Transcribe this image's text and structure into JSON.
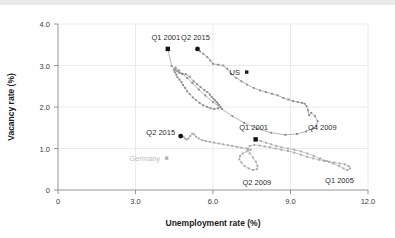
{
  "chart_data": {
    "type": "scatter",
    "title": "",
    "xlabel": "Unemployment rate (%)",
    "ylabel": "Vacancy rate (%)",
    "xlim": [
      0,
      12.0
    ],
    "ylim": [
      0,
      4.0
    ],
    "xticks": [
      "0",
      "3.0",
      "6.0",
      "9.0",
      "12.0"
    ],
    "xtick_values": [
      0,
      3.0,
      6.0,
      9.0,
      12.0
    ],
    "yticks": [
      "0",
      "1.0",
      "2.0",
      "3.0",
      "4.0"
    ],
    "ytick_values": [
      0,
      1.0,
      2.0,
      3.0,
      4.0
    ],
    "grid": "horizontal-and-vertical-light",
    "legend_position": "inside-plot",
    "legend": [
      {
        "name": "US",
        "marker": "square",
        "color": "#1a1a1a"
      },
      {
        "name": "Germany",
        "marker": "square",
        "color": "#b4b4b4"
      }
    ],
    "annotations": [
      {
        "text": "Q1 2001",
        "series": "US",
        "x": 4.25,
        "y": 3.4,
        "marker": "square",
        "label_dx": -2,
        "label_dy": -9
      },
      {
        "text": "Q2 2015",
        "series": "US",
        "x": 5.4,
        "y": 3.4,
        "marker": "circle",
        "label_dx": -2,
        "label_dy": -9
      },
      {
        "text": "Q4 2009",
        "series": "US",
        "x": 10.0,
        "y": 1.55,
        "marker": "none",
        "label_dx": 6,
        "label_dy": 4
      },
      {
        "text": "Q1 2001",
        "series": "Germany",
        "x": 7.65,
        "y": 1.22,
        "marker": "square",
        "label_dx": -2,
        "label_dy": -9
      },
      {
        "text": "Q2 2015",
        "series": "Germany",
        "x": 4.75,
        "y": 1.3,
        "marker": "circle",
        "label_dx": -20,
        "label_dy": -1
      },
      {
        "text": "Q2 2009",
        "series": "Germany",
        "x": 7.7,
        "y": 0.42,
        "marker": "none",
        "label_dx": 0,
        "label_dy": 12
      },
      {
        "text": "Q1 2005",
        "series": "Germany",
        "x": 11.05,
        "y": 0.45,
        "marker": "none",
        "label_dx": -4,
        "label_dy": 12
      }
    ],
    "series": [
      {
        "name": "US",
        "color": "#8c8c8c",
        "marker": "square",
        "marker_color": "#8c8c8c",
        "points": [
          [
            4.25,
            3.4
          ],
          [
            4.4,
            2.99
          ],
          [
            4.55,
            2.9
          ],
          [
            4.62,
            2.86
          ],
          [
            4.7,
            2.82
          ],
          [
            4.8,
            2.8
          ],
          [
            4.95,
            2.79
          ],
          [
            5.1,
            2.73
          ],
          [
            5.25,
            2.62
          ],
          [
            5.38,
            2.55
          ],
          [
            5.52,
            2.48
          ],
          [
            5.66,
            2.41
          ],
          [
            5.78,
            2.36
          ],
          [
            5.88,
            2.3
          ],
          [
            5.95,
            2.24
          ],
          [
            6.02,
            2.2
          ],
          [
            6.08,
            2.16
          ],
          [
            6.14,
            2.12
          ],
          [
            6.18,
            2.08
          ],
          [
            6.24,
            2.05
          ],
          [
            6.3,
            2.0
          ],
          [
            6.2,
            1.97
          ],
          [
            6.05,
            1.95
          ],
          [
            5.9,
            1.97
          ],
          [
            5.78,
            2.0
          ],
          [
            5.62,
            2.04
          ],
          [
            5.48,
            2.1
          ],
          [
            5.34,
            2.17
          ],
          [
            5.22,
            2.23
          ],
          [
            5.1,
            2.31
          ],
          [
            5.0,
            2.38
          ],
          [
            4.92,
            2.46
          ],
          [
            4.84,
            2.53
          ],
          [
            4.78,
            2.6
          ],
          [
            4.7,
            2.66
          ],
          [
            4.62,
            2.72
          ],
          [
            4.58,
            2.78
          ],
          [
            4.52,
            2.84
          ],
          [
            4.48,
            2.9
          ],
          [
            4.55,
            2.95
          ],
          [
            4.68,
            2.88
          ],
          [
            4.82,
            2.8
          ],
          [
            5.0,
            2.7
          ],
          [
            5.2,
            2.58
          ],
          [
            5.45,
            2.42
          ],
          [
            5.7,
            2.28
          ],
          [
            6.0,
            2.12
          ],
          [
            6.35,
            1.95
          ],
          [
            6.75,
            1.78
          ],
          [
            7.2,
            1.62
          ],
          [
            7.7,
            1.48
          ],
          [
            8.25,
            1.38
          ],
          [
            8.8,
            1.33
          ],
          [
            9.25,
            1.35
          ],
          [
            9.6,
            1.41
          ],
          [
            9.85,
            1.48
          ],
          [
            10.0,
            1.55
          ],
          [
            10.05,
            1.66
          ],
          [
            9.95,
            1.78
          ],
          [
            9.8,
            1.86
          ],
          [
            9.72,
            1.8
          ],
          [
            9.68,
            1.92
          ],
          [
            9.62,
            2.02
          ],
          [
            9.55,
            2.08
          ],
          [
            9.45,
            2.1
          ],
          [
            9.28,
            2.12
          ],
          [
            9.1,
            2.14
          ],
          [
            8.92,
            2.18
          ],
          [
            8.72,
            2.22
          ],
          [
            8.5,
            2.28
          ],
          [
            8.28,
            2.32
          ],
          [
            8.05,
            2.36
          ],
          [
            7.82,
            2.4
          ],
          [
            7.58,
            2.46
          ],
          [
            7.32,
            2.54
          ],
          [
            7.1,
            2.62
          ],
          [
            6.9,
            2.7
          ],
          [
            6.7,
            2.8
          ],
          [
            6.55,
            2.92
          ],
          [
            6.4,
            3.0
          ],
          [
            6.2,
            3.02
          ],
          [
            6.0,
            3.04
          ],
          [
            5.9,
            3.12
          ],
          [
            5.78,
            3.2
          ],
          [
            5.62,
            3.28
          ],
          [
            5.5,
            3.34
          ],
          [
            5.4,
            3.4
          ]
        ]
      },
      {
        "name": "Germany",
        "color": "#a8a8a8",
        "marker": "square",
        "marker_color": "#a8a8a8",
        "points": [
          [
            7.65,
            1.22
          ],
          [
            7.85,
            1.18
          ],
          [
            8.05,
            1.14
          ],
          [
            8.25,
            1.1
          ],
          [
            8.45,
            1.06
          ],
          [
            8.65,
            1.03
          ],
          [
            8.9,
            1.0
          ],
          [
            9.15,
            0.97
          ],
          [
            9.4,
            0.93
          ],
          [
            9.65,
            0.88
          ],
          [
            9.9,
            0.82
          ],
          [
            10.15,
            0.76
          ],
          [
            10.4,
            0.7
          ],
          [
            10.65,
            0.64
          ],
          [
            10.88,
            0.58
          ],
          [
            11.05,
            0.52
          ],
          [
            11.2,
            0.48
          ],
          [
            11.3,
            0.52
          ],
          [
            11.25,
            0.58
          ],
          [
            11.1,
            0.62
          ],
          [
            10.9,
            0.64
          ],
          [
            10.7,
            0.66
          ],
          [
            10.5,
            0.68
          ],
          [
            10.3,
            0.7
          ],
          [
            10.1,
            0.73
          ],
          [
            9.88,
            0.76
          ],
          [
            9.65,
            0.8
          ],
          [
            9.4,
            0.85
          ],
          [
            9.15,
            0.9
          ],
          [
            8.9,
            0.94
          ],
          [
            8.65,
            0.97
          ],
          [
            8.42,
            1.0
          ],
          [
            8.2,
            1.03
          ],
          [
            8.0,
            1.05
          ],
          [
            7.8,
            1.07
          ],
          [
            7.6,
            1.09
          ],
          [
            7.42,
            1.06
          ],
          [
            7.35,
            0.98
          ],
          [
            7.42,
            0.88
          ],
          [
            7.55,
            0.78
          ],
          [
            7.66,
            0.68
          ],
          [
            7.72,
            0.58
          ],
          [
            7.7,
            0.5
          ],
          [
            7.55,
            0.48
          ],
          [
            7.38,
            0.52
          ],
          [
            7.22,
            0.58
          ],
          [
            7.1,
            0.66
          ],
          [
            7.02,
            0.74
          ],
          [
            7.05,
            0.82
          ],
          [
            7.15,
            0.88
          ],
          [
            7.3,
            0.93
          ],
          [
            7.46,
            0.97
          ],
          [
            7.3,
            1.0
          ],
          [
            7.1,
            1.02
          ],
          [
            6.92,
            1.04
          ],
          [
            6.74,
            1.06
          ],
          [
            6.58,
            1.08
          ],
          [
            6.4,
            1.1
          ],
          [
            6.22,
            1.12
          ],
          [
            6.05,
            1.14
          ],
          [
            5.88,
            1.16
          ],
          [
            5.72,
            1.18
          ],
          [
            5.58,
            1.2
          ],
          [
            5.45,
            1.24
          ],
          [
            5.35,
            1.28
          ],
          [
            5.28,
            1.34
          ],
          [
            5.2,
            1.36
          ],
          [
            5.12,
            1.3
          ],
          [
            5.05,
            1.24
          ],
          [
            4.98,
            1.22
          ],
          [
            4.92,
            1.24
          ],
          [
            4.86,
            1.28
          ],
          [
            4.8,
            1.3
          ],
          [
            4.75,
            1.3
          ]
        ]
      }
    ]
  },
  "axes": {
    "x_title": "Unemployment rate (%)",
    "y_title": "Vacancy rate (%)"
  }
}
